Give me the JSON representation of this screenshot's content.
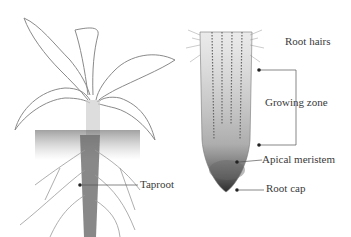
{
  "figure": {
    "left_panel": {
      "subject": "Whole plant with taproot system",
      "labels": {
        "taproot": "Taproot"
      }
    },
    "right_panel": {
      "subject": "Root tip cross-section",
      "labels": {
        "root_hairs": "Root hairs",
        "growing_zone": "Growing zone",
        "apical_meristem": "Apical meristem",
        "root_cap": "Root cap"
      }
    },
    "colors": {
      "ink": "#3a3a3a",
      "sketch": "#8a8a8a",
      "background": "#ffffff"
    }
  }
}
